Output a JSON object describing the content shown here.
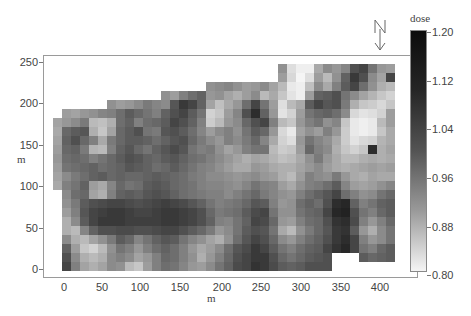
{
  "chart_data": {
    "type": "heatmap",
    "title": "",
    "xlabel": "m",
    "ylabel": "m",
    "x_ticks": [
      "0",
      "50",
      "100",
      "150",
      "200",
      "250",
      "300",
      "350",
      "400"
    ],
    "y_ticks": [
      "0",
      "50",
      "100",
      "150",
      "200",
      "250"
    ],
    "xlim": [
      -12,
      425
    ],
    "ylim": [
      -8,
      262
    ],
    "colorbar": {
      "title": "dose",
      "ticks": [
        "0.80",
        "0.88",
        "0.96",
        "1.04",
        "1.12",
        "1.20"
      ],
      "range": [
        0.8,
        1.2
      ],
      "colormap": "grayscale (white=low, black=high)"
    },
    "grid": {
      "cols": 38,
      "rows": 23,
      "cell_m_x": 11,
      "cell_m_y": 11,
      "origin_m": [
        -12,
        250
      ]
    },
    "values": [
      [
        null,
        null,
        null,
        null,
        null,
        null,
        null,
        null,
        null,
        null,
        null,
        null,
        null,
        null,
        null,
        null,
        null,
        null,
        null,
        null,
        null,
        null,
        null,
        null,
        null,
        0.97,
        0.84,
        0.81,
        0.81,
        0.93,
        0.98,
        0.96,
        0.99,
        1.08,
        1.1,
        1.02,
        0.96,
        0.95
      ],
      [
        null,
        null,
        null,
        null,
        null,
        null,
        null,
        null,
        null,
        null,
        null,
        null,
        null,
        null,
        null,
        null,
        null,
        null,
        null,
        null,
        null,
        null,
        null,
        null,
        null,
        0.95,
        0.85,
        0.8,
        0.84,
        0.95,
        0.9,
        0.97,
        1.05,
        1.12,
        1.08,
        0.98,
        0.94,
        1.1
      ],
      [
        null,
        null,
        null,
        null,
        null,
        null,
        null,
        null,
        null,
        null,
        null,
        null,
        null,
        null,
        null,
        null,
        null,
        0.97,
        0.98,
        0.99,
        0.97,
        0.95,
        0.96,
        0.98,
        0.94,
        0.9,
        0.82,
        0.81,
        0.89,
        0.98,
        0.93,
        1.0,
        1.06,
        1.1,
        1.03,
        0.97,
        0.92,
        0.9
      ],
      [
        null,
        null,
        null,
        null,
        null,
        null,
        null,
        null,
        null,
        null,
        null,
        null,
        0.97,
        0.95,
        1.0,
        1.03,
        1.05,
        0.96,
        0.97,
        0.94,
        0.92,
        0.95,
        0.98,
        0.9,
        0.93,
        0.88,
        0.83,
        0.81,
        0.95,
        1.05,
        1.06,
        1.08,
        1.02,
        0.98,
        0.94,
        0.91,
        0.88,
        0.86
      ],
      [
        null,
        null,
        null,
        null,
        null,
        null,
        0.97,
        0.95,
        0.96,
        0.98,
        1.01,
        0.99,
        0.98,
        1.07,
        1.12,
        1.1,
        1.05,
        0.94,
        0.89,
        0.93,
        0.96,
        1.03,
        1.1,
        1.02,
        0.95,
        0.84,
        0.9,
        0.93,
        1.06,
        1.1,
        1.07,
        1.08,
        1.01,
        0.92,
        0.88,
        0.87,
        0.85,
        0.88
      ],
      [
        null,
        0.95,
        0.94,
        0.96,
        0.97,
        0.99,
        1.0,
        1.03,
        1.06,
        1.04,
        1.02,
        1.0,
        1.05,
        1.08,
        1.1,
        1.06,
        1.02,
        0.86,
        0.88,
        0.95,
        0.99,
        1.08,
        1.14,
        1.05,
        0.96,
        0.83,
        0.86,
        0.95,
        1.02,
        1.04,
        1.05,
        1.03,
        0.98,
        0.85,
        0.83,
        0.84,
        0.86,
        0.95
      ],
      [
        0.94,
        0.96,
        0.98,
        1.01,
        0.9,
        0.89,
        0.92,
        1.03,
        1.05,
        1.0,
        1.03,
        1.04,
        1.06,
        1.1,
        1.08,
        1.05,
        1.0,
        0.87,
        0.9,
        0.96,
        0.98,
        1.04,
        1.08,
        1.1,
        1.0,
        0.9,
        0.88,
        0.96,
        1.0,
        1.02,
        0.97,
        0.99,
        0.88,
        0.82,
        0.81,
        0.82,
        0.9,
        0.95
      ],
      [
        0.93,
        1.04,
        1.06,
        1.07,
        0.92,
        0.88,
        0.94,
        1.04,
        1.06,
        1.08,
        1.02,
        1.01,
        1.07,
        1.08,
        1.06,
        1.03,
        0.99,
        0.95,
        0.98,
        1.0,
        0.97,
        1.02,
        1.06,
        1.04,
        0.96,
        0.85,
        0.82,
        0.94,
        0.97,
        0.95,
        1.0,
        0.96,
        0.87,
        0.82,
        0.81,
        0.82,
        0.88,
        0.93
      ],
      [
        0.94,
        1.05,
        1.08,
        1.04,
        1.0,
        0.93,
        1.01,
        1.04,
        1.06,
        1.06,
        1.05,
        1.03,
        1.05,
        1.07,
        1.08,
        1.04,
        1.01,
        0.98,
        0.96,
        1.0,
        0.98,
        1.01,
        1.04,
        0.99,
        0.93,
        0.86,
        0.84,
        0.96,
        1.02,
        0.99,
        0.97,
        0.93,
        0.87,
        0.83,
        0.85,
        0.86,
        0.91,
        0.93
      ],
      [
        0.95,
        1.04,
        1.05,
        1.01,
        0.91,
        0.9,
        1.0,
        1.05,
        1.07,
        1.04,
        1.02,
        1.05,
        1.07,
        1.09,
        1.07,
        1.02,
        1.0,
        1.01,
        0.97,
        0.94,
        0.96,
        1.0,
        1.02,
        1.02,
        0.9,
        0.87,
        0.88,
        0.95,
        1.04,
        1.0,
        0.98,
        0.92,
        0.88,
        0.86,
        0.88,
        1.14,
        0.92,
        0.94
      ],
      [
        0.96,
        1.03,
        1.04,
        1.03,
        1.0,
        1.02,
        1.04,
        1.06,
        1.08,
        1.07,
        1.05,
        1.04,
        1.06,
        1.07,
        1.05,
        1.03,
        1.02,
        1.0,
        0.98,
        0.96,
        0.94,
        0.92,
        0.94,
        0.93,
        0.91,
        0.89,
        0.9,
        0.93,
        0.97,
        1.01,
        0.96,
        0.93,
        0.9,
        0.9,
        0.92,
        0.93,
        0.92,
        0.93
      ],
      [
        0.95,
        1.02,
        1.03,
        1.04,
        1.05,
        1.03,
        1.04,
        1.05,
        1.07,
        1.06,
        1.05,
        1.03,
        1.04,
        1.06,
        1.04,
        1.02,
        1.0,
        0.99,
        0.97,
        0.95,
        0.93,
        0.93,
        0.96,
        0.95,
        0.93,
        0.92,
        0.92,
        0.94,
        0.96,
        0.98,
        0.95,
        0.93,
        0.92,
        0.93,
        0.94,
        0.95,
        0.94,
        0.95
      ],
      [
        0.94,
        0.98,
        1.01,
        1.03,
        1.05,
        1.06,
        1.04,
        1.05,
        1.04,
        1.04,
        1.05,
        1.06,
        1.05,
        1.04,
        1.03,
        1.01,
        1.0,
        0.98,
        0.98,
        0.97,
        0.96,
        0.97,
        0.98,
        0.96,
        0.95,
        0.92,
        0.9,
        0.95,
        1.0,
        0.98,
        0.97,
        1.01,
        0.96,
        0.93,
        0.92,
        0.94,
        0.93,
        0.93
      ],
      [
        0.93,
        1.0,
        1.02,
        1.05,
        0.95,
        0.93,
        0.99,
        1.04,
        1.02,
        1.03,
        1.06,
        1.07,
        1.06,
        1.04,
        1.03,
        1.02,
        1.0,
        0.99,
        0.99,
        0.98,
        0.97,
        0.99,
        1.02,
        1.0,
        0.99,
        0.95,
        0.93,
        0.97,
        1.0,
        1.01,
        1.03,
        1.06,
        0.99,
        0.95,
        0.94,
        0.95,
        0.97,
        0.99
      ],
      [
        null,
        0.98,
        1.03,
        1.04,
        0.94,
        0.92,
        1.0,
        1.05,
        1.06,
        1.05,
        1.07,
        1.08,
        1.07,
        1.05,
        1.03,
        1.02,
        1.01,
        1.0,
        1.0,
        0.98,
        1.0,
        1.02,
        1.04,
        1.01,
        0.99,
        0.97,
        0.96,
        1.0,
        1.03,
        1.05,
        1.07,
        1.1,
        1.03,
        1.0,
        0.97,
        0.98,
        1.02,
        1.04
      ],
      [
        null,
        0.97,
        1.01,
        1.06,
        1.08,
        1.09,
        1.1,
        1.1,
        1.09,
        1.08,
        1.09,
        1.1,
        1.11,
        1.1,
        1.09,
        1.07,
        1.05,
        1.02,
        1.0,
        1.01,
        1.02,
        1.04,
        1.07,
        1.06,
        1.0,
        0.96,
        0.97,
        1.03,
        1.05,
        1.03,
        1.08,
        1.14,
        1.15,
        1.05,
        1.0,
        1.02,
        1.05,
        1.06
      ],
      [
        null,
        0.95,
        1.0,
        1.07,
        1.1,
        1.11,
        1.12,
        1.12,
        1.11,
        1.1,
        1.1,
        1.11,
        1.12,
        1.12,
        1.11,
        1.1,
        1.08,
        1.04,
        1.01,
        1.02,
        1.03,
        1.06,
        1.09,
        1.1,
        1.02,
        0.97,
        0.97,
        1.02,
        1.04,
        1.05,
        1.1,
        1.15,
        1.16,
        1.08,
        1.02,
        1.0,
        1.04,
        1.06
      ],
      [
        null,
        0.92,
        0.98,
        1.06,
        1.1,
        1.12,
        1.12,
        1.12,
        1.11,
        1.11,
        1.11,
        1.11,
        1.12,
        1.12,
        1.11,
        1.1,
        1.08,
        1.05,
        1.0,
        0.99,
        1.02,
        1.05,
        1.1,
        1.09,
        1.04,
        0.96,
        0.95,
        1.0,
        1.03,
        1.04,
        1.08,
        1.13,
        1.14,
        1.09,
        1.0,
        0.96,
        1.0,
        1.04
      ],
      [
        null,
        0.92,
        0.9,
        0.99,
        1.05,
        1.08,
        1.08,
        1.09,
        1.09,
        1.08,
        1.08,
        1.09,
        1.1,
        1.1,
        1.08,
        1.06,
        1.04,
        1.01,
        0.96,
        0.98,
        1.02,
        1.06,
        1.08,
        1.07,
        1.02,
        0.93,
        0.9,
        0.97,
        1.01,
        1.04,
        1.07,
        1.12,
        1.13,
        1.06,
        0.96,
        0.92,
        0.98,
        1.02
      ],
      [
        null,
        0.98,
        0.92,
        0.9,
        0.94,
        0.97,
        1.01,
        1.06,
        1.04,
        0.99,
        1.02,
        1.05,
        1.07,
        1.06,
        1.02,
        0.99,
        0.97,
        0.94,
        0.92,
        0.97,
        1.03,
        1.07,
        1.1,
        1.08,
        1.04,
        0.98,
        0.96,
        1.0,
        1.03,
        1.05,
        1.08,
        1.12,
        1.14,
        1.1,
        1.0,
        0.96,
        0.98,
        1.02
      ],
      [
        null,
        1.05,
        0.95,
        0.88,
        0.86,
        0.9,
        0.97,
        1.02,
        1.0,
        0.96,
        1.0,
        1.03,
        1.05,
        1.03,
        1.0,
        0.96,
        0.93,
        0.95,
        0.98,
        1.03,
        1.07,
        1.09,
        1.12,
        1.1,
        1.06,
        1.02,
        1.0,
        1.03,
        1.05,
        1.06,
        1.1,
        1.13,
        1.15,
        1.1,
        1.02,
        1.0,
        1.04,
        1.06
      ],
      [
        null,
        1.08,
        0.98,
        0.92,
        0.9,
        0.92,
        0.98,
        1.0,
        0.98,
        0.94,
        0.96,
        1.0,
        1.04,
        1.03,
        1.0,
        0.97,
        0.92,
        0.96,
        1.0,
        1.04,
        1.08,
        1.1,
        1.12,
        1.12,
        1.08,
        1.04,
        1.02,
        1.04,
        1.06,
        1.07,
        1.08,
        null,
        null,
        null,
        1.06,
        1.04,
        1.05,
        1.06
      ],
      [
        null,
        1.1,
        1.0,
        0.94,
        0.92,
        0.94,
        0.98,
        0.97,
        0.9,
        0.88,
        0.95,
        1.0,
        1.03,
        1.02,
        0.99,
        0.96,
        0.95,
        0.98,
        1.02,
        1.05,
        1.09,
        1.1,
        1.13,
        1.12,
        1.09,
        1.06,
        1.05,
        1.06,
        1.08,
        1.08,
        1.08,
        null,
        null,
        null,
        null,
        null,
        null,
        null
      ]
    ]
  },
  "compass": {
    "label": "N",
    "icon": "north-arrow-icon"
  }
}
